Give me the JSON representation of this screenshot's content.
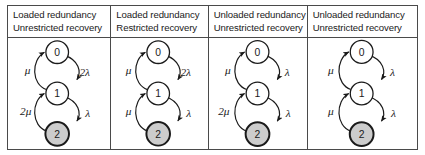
{
  "figure": {
    "type": "markov-state-transition-diagrams",
    "panel_count": 4,
    "colors": {
      "border": "#4a4a4a",
      "stroke": "#1a1a1a",
      "node_fill_normal": "#ffffff",
      "node_fill_failed": "#cccccc",
      "text": "#1a1a1a",
      "background": "#ffffff"
    }
  },
  "panels": [
    {
      "header": {
        "line1": "Loaded redundancy",
        "line2": "Unrestricted recovery"
      },
      "states": [
        {
          "label": "0",
          "shaded": false
        },
        {
          "label": "1",
          "shaded": false
        },
        {
          "label": "2",
          "shaded": true
        }
      ],
      "transitions": {
        "failure_0_to_1": "2λ",
        "failure_1_to_2": "λ",
        "repair_1_to_0": "μ",
        "repair_2_to_1": "2μ"
      }
    },
    {
      "header": {
        "line1": "Loaded redundancy",
        "line2": "Restricted recovery"
      },
      "states": [
        {
          "label": "0",
          "shaded": false
        },
        {
          "label": "1",
          "shaded": false
        },
        {
          "label": "2",
          "shaded": true
        }
      ],
      "transitions": {
        "failure_0_to_1": "2λ",
        "failure_1_to_2": "λ",
        "repair_1_to_0": "μ",
        "repair_2_to_1": "μ"
      }
    },
    {
      "header": {
        "line1": "Unloaded redundancy",
        "line2": "Unrestricted recovery"
      },
      "states": [
        {
          "label": "0",
          "shaded": false
        },
        {
          "label": "1",
          "shaded": false
        },
        {
          "label": "2",
          "shaded": true
        }
      ],
      "transitions": {
        "failure_0_to_1": "λ",
        "failure_1_to_2": "λ",
        "repair_1_to_0": "μ",
        "repair_2_to_1": "2μ"
      }
    },
    {
      "header": {
        "line1": "Unloaded redundancy",
        "line2": "Unrestricted recovery"
      },
      "states": [
        {
          "label": "0",
          "shaded": false
        },
        {
          "label": "1",
          "shaded": false
        },
        {
          "label": "2",
          "shaded": true
        }
      ],
      "transitions": {
        "failure_0_to_1": "λ",
        "failure_1_to_2": "λ",
        "repair_1_to_0": "μ",
        "repair_2_to_1": "μ"
      }
    }
  ]
}
